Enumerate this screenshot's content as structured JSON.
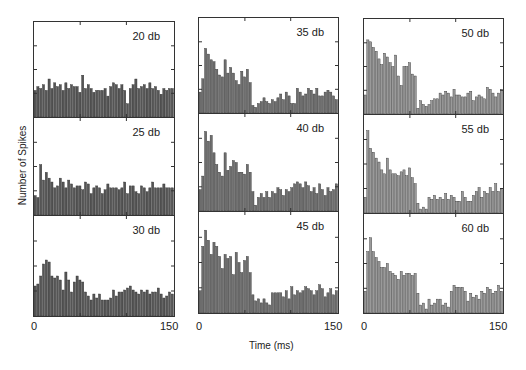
{
  "chart_data": {
    "type": "bar",
    "title": "",
    "xlabel": "Time (ms)",
    "ylabel": "Number of Spikes",
    "xlim": [
      0,
      150
    ],
    "x_ticks": [
      "0",
      "150"
    ],
    "layout": "3x3 grid of histograms, columns share x-axis ticks",
    "grid": false,
    "legend": null,
    "bin_width_ms": 3,
    "value_scale": "relative bar height (0-100 of panel height)",
    "panels": [
      {
        "label": "20 db",
        "column": 0,
        "row": 0,
        "color": "#555555",
        "values": [
          28,
          32,
          30,
          34,
          28,
          40,
          30,
          36,
          32,
          34,
          28,
          36,
          30,
          34,
          32,
          32,
          26,
          44,
          30,
          34,
          30,
          26,
          28,
          28,
          28,
          30,
          22,
          32,
          36,
          34,
          30,
          34,
          28,
          14,
          30,
          34,
          40,
          30,
          32,
          34,
          30,
          36,
          30,
          32,
          28,
          24,
          30,
          28,
          30,
          30
        ]
      },
      {
        "label": "25 db",
        "column": 0,
        "row": 1,
        "color": "#555555",
        "values": [
          20,
          18,
          52,
          36,
          44,
          38,
          34,
          28,
          30,
          38,
          34,
          28,
          36,
          32,
          28,
          30,
          30,
          26,
          34,
          32,
          22,
          28,
          30,
          28,
          22,
          26,
          32,
          28,
          28,
          28,
          26,
          28,
          34,
          22,
          30,
          30,
          24,
          22,
          30,
          28,
          24,
          28,
          34,
          28,
          28,
          28,
          32,
          28,
          28,
          28
        ]
      },
      {
        "label": "30 db",
        "column": 0,
        "row": 2,
        "color": "#555555",
        "values": [
          30,
          32,
          40,
          52,
          56,
          54,
          40,
          38,
          40,
          36,
          26,
          44,
          36,
          24,
          34,
          40,
          36,
          34,
          24,
          20,
          16,
          22,
          18,
          22,
          16,
          16,
          16,
          18,
          26,
          20,
          24,
          24,
          26,
          28,
          30,
          26,
          24,
          22,
          26,
          24,
          26,
          22,
          24,
          24,
          28,
          22,
          18,
          20,
          24,
          22
        ]
      },
      {
        "label": "35 db",
        "column": 1,
        "row": 0,
        "color": "#6e6e6e",
        "values": [
          22,
          36,
          68,
          62,
          56,
          54,
          46,
          40,
          38,
          56,
          42,
          48,
          42,
          34,
          30,
          44,
          38,
          46,
          32,
          8,
          6,
          10,
          12,
          16,
          12,
          10,
          14,
          12,
          16,
          20,
          14,
          22,
          18,
          10,
          10,
          26,
          22,
          18,
          20,
          26,
          24,
          20,
          26,
          18,
          18,
          22,
          24,
          22,
          18,
          14
        ]
      },
      {
        "label": "40 db",
        "column": 1,
        "row": 1,
        "color": "#6e6e6e",
        "values": [
          22,
          36,
          82,
          72,
          78,
          60,
          48,
          40,
          36,
          60,
          42,
          46,
          52,
          50,
          40,
          40,
          38,
          48,
          40,
          20,
          6,
          14,
          18,
          14,
          20,
          14,
          20,
          18,
          24,
          22,
          16,
          22,
          20,
          24,
          28,
          30,
          28,
          24,
          30,
          26,
          20,
          24,
          18,
          28,
          22,
          16,
          24,
          20,
          22,
          28
        ]
      },
      {
        "label": "45 db",
        "column": 1,
        "row": 2,
        "color": "#6e6e6e",
        "values": [
          22,
          66,
          82,
          72,
          58,
          70,
          66,
          56,
          44,
          58,
          54,
          56,
          38,
          60,
          50,
          40,
          52,
          56,
          40,
          18,
          12,
          14,
          10,
          14,
          10,
          8,
          20,
          20,
          20,
          20,
          16,
          22,
          14,
          26,
          18,
          22,
          20,
          22,
          26,
          24,
          22,
          18,
          22,
          28,
          24,
          16,
          20,
          24,
          18,
          22
        ]
      },
      {
        "label": "50 db",
        "column": 2,
        "row": 0,
        "color": "#9a9a9a",
        "values": [
          20,
          78,
          76,
          70,
          66,
          58,
          52,
          64,
          60,
          54,
          50,
          62,
          40,
          30,
          50,
          50,
          54,
          42,
          40,
          6,
          14,
          10,
          8,
          10,
          14,
          16,
          16,
          22,
          20,
          24,
          22,
          18,
          26,
          20,
          20,
          18,
          18,
          22,
          24,
          14,
          18,
          20,
          18,
          16,
          28,
          26,
          22,
          18,
          22,
          26
        ]
      },
      {
        "label": "55 db",
        "column": 2,
        "row": 1,
        "color": "#9a9a9a",
        "values": [
          16,
          84,
          66,
          62,
          56,
          52,
          44,
          40,
          56,
          44,
          40,
          40,
          38,
          42,
          44,
          38,
          46,
          36,
          30,
          10,
          4,
          6,
          4,
          16,
          14,
          18,
          14,
          16,
          14,
          20,
          14,
          18,
          16,
          12,
          12,
          22,
          16,
          12,
          12,
          18,
          22,
          26,
          16,
          22,
          20,
          26,
          22,
          30,
          22,
          24
        ]
      },
      {
        "label": "60 db",
        "column": 2,
        "row": 2,
        "color": "#9a9a9a",
        "values": [
          22,
          62,
          76,
          62,
          56,
          52,
          46,
          46,
          50,
          42,
          40,
          38,
          34,
          42,
          38,
          40,
          40,
          38,
          40,
          20,
          8,
          10,
          4,
          14,
          8,
          10,
          14,
          14,
          8,
          10,
          6,
          22,
          28,
          26,
          26,
          26,
          22,
          12,
          20,
          16,
          18,
          14,
          22,
          20,
          26,
          24,
          20,
          22,
          28,
          22
        ]
      }
    ]
  },
  "labels": {
    "y_axis": "Number of Spikes",
    "x_axis": "Time (ms)",
    "tick_0": "0",
    "tick_150": "150"
  }
}
